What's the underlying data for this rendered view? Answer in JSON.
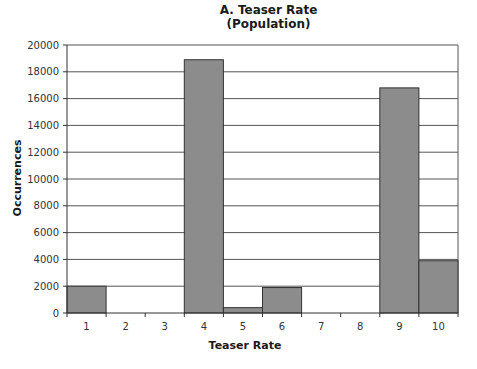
{
  "chart_data": {
    "type": "bar",
    "title": "A. Teaser Rate",
    "subtitle": "(Population)",
    "xlabel": "Teaser Rate",
    "ylabel": "Occurrences",
    "categories": [
      "1",
      "2",
      "3",
      "4",
      "5",
      "6",
      "7",
      "8",
      "9",
      "10"
    ],
    "values": [
      2000,
      0,
      0,
      18900,
      400,
      1900,
      0,
      0,
      16800,
      3900
    ],
    "ylim": [
      0,
      20000
    ],
    "yticks": [
      0,
      2000,
      4000,
      6000,
      8000,
      10000,
      12000,
      14000,
      16000,
      18000,
      20000
    ],
    "grid": true,
    "legend": null,
    "bar_color": "#8c8c8c",
    "bar_edge_color": "#333333",
    "grid_color": "#555555"
  }
}
